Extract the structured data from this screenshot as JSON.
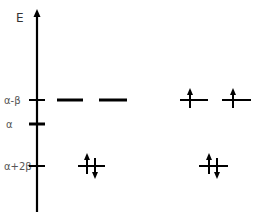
{
  "diagram": {
    "axis_label": "E",
    "levels": [
      {
        "label": "α-β",
        "y": 100
      },
      {
        "label": "α",
        "y": 124
      },
      {
        "label": "α+2β",
        "y": 166
      }
    ],
    "left_diagram": {
      "orbitals": [
        {
          "level": "α-β",
          "x1": 57,
          "x2": 83,
          "electrons": "none"
        },
        {
          "level": "α-β",
          "x1": 99,
          "x2": 127,
          "electrons": "none"
        },
        {
          "level": "α+2β",
          "x1": 78,
          "x2": 105,
          "electrons": "up-down pair"
        }
      ]
    },
    "right_diagram": {
      "orbitals": [
        {
          "level": "α-β",
          "x1": 180,
          "x2": 208,
          "electrons": "up"
        },
        {
          "level": "α-β",
          "x1": 222,
          "x2": 251,
          "electrons": "up"
        },
        {
          "level": "α+2β",
          "x1": 199,
          "x2": 228,
          "electrons": "up-down pair"
        }
      ]
    },
    "colors": {
      "line": "#000000",
      "label": "#555555"
    }
  }
}
